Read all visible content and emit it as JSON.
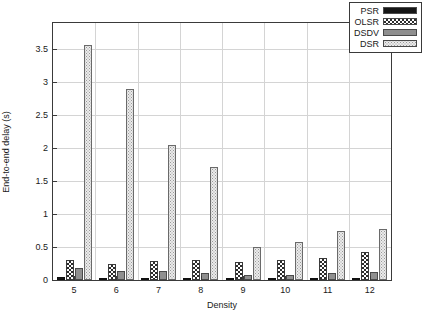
{
  "chart_data": {
    "type": "bar",
    "title": "",
    "xlabel": "Density",
    "ylabel": "End-to-end delay (s)",
    "categories": [
      "5",
      "6",
      "7",
      "8",
      "9",
      "10",
      "11",
      "12"
    ],
    "ylim": [
      0,
      3.9
    ],
    "yticks": [
      0,
      0.5,
      1,
      1.5,
      2,
      2.5,
      3,
      3.5
    ],
    "ytick_labels": [
      "0",
      "0.5",
      "1",
      "1.5",
      "2",
      "2.5",
      "3",
      "3.5"
    ],
    "grid": true,
    "legend_position": "top-right",
    "series": [
      {
        "name": "PSR",
        "pattern": "solid-black",
        "color": "#161616",
        "values": [
          0.04,
          0.02,
          0.02,
          0.02,
          0.02,
          0.02,
          0.03,
          0.03
        ]
      },
      {
        "name": "OLSR",
        "pattern": "checkerboard",
        "color": "#2b2b2b",
        "values": [
          0.31,
          0.25,
          0.29,
          0.31,
          0.27,
          0.31,
          0.34,
          0.42
        ]
      },
      {
        "name": "DSDV",
        "pattern": "solid-gray",
        "color": "#8f8f8f",
        "values": [
          0.18,
          0.13,
          0.13,
          0.1,
          0.07,
          0.07,
          0.1,
          0.12
        ]
      },
      {
        "name": "DSR",
        "pattern": "fine-dots",
        "color": "#ebebeb",
        "values": [
          3.56,
          2.9,
          2.05,
          1.72,
          0.5,
          0.58,
          0.75,
          0.78
        ]
      }
    ]
  },
  "legend": {
    "entries": [
      {
        "label": "PSR"
      },
      {
        "label": "OLSR"
      },
      {
        "label": "DSDV"
      },
      {
        "label": "DSR"
      }
    ]
  }
}
